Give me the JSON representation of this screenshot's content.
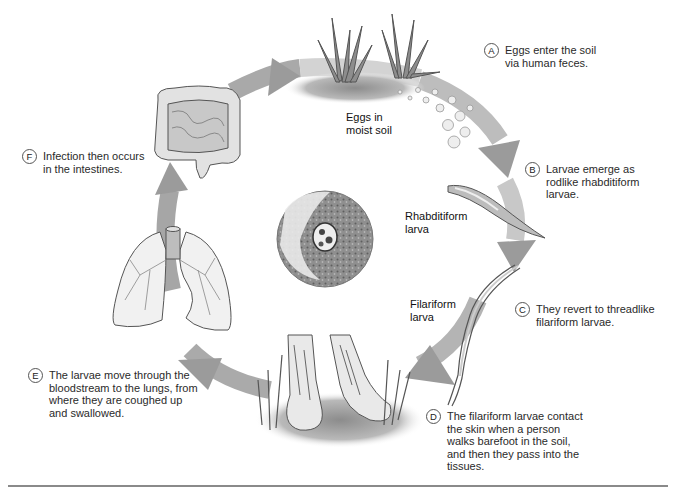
{
  "figure": {
    "type": "life-cycle diagram",
    "accent_colors": {
      "arrow": "#9a9a9a",
      "arrow_light": "#d8d8d8",
      "outline": "#555555",
      "rule": "#8a8a8a"
    }
  },
  "steps": [
    {
      "letter": "A",
      "text": "Eggs enter the soil\nvia human feces."
    },
    {
      "letter": "B",
      "text": "Larvae emerge as\nrodlike rhabditiform\nlarvae."
    },
    {
      "letter": "C",
      "text": "They revert to threadlike\nfilariform larvae."
    },
    {
      "letter": "D",
      "text": "The filariform larvae contact\nthe skin when a person\nwalks barefoot in the soil,\nand then they pass into the\ntissues."
    },
    {
      "letter": "E",
      "text": "The larvae move through the\nbloodstream to the lungs, from\nwhere they are coughed up\nand swallowed."
    },
    {
      "letter": "F",
      "text": "Infection then occurs\nin the intestines."
    }
  ],
  "labels": {
    "eggs": "Eggs in\nmoist soil",
    "rhabditiform": "Rhabditiform\nlarva",
    "filariform": "Filariform\nlarva"
  },
  "illustrations": [
    {
      "name": "grass-tufts-icon",
      "depicts": "grass in soil with eggs"
    },
    {
      "name": "rhabditiform-larva-icon",
      "depicts": "rodlike larva"
    },
    {
      "name": "filariform-larva-icon",
      "depicts": "threadlike larva"
    },
    {
      "name": "bare-feet-icon",
      "depicts": "bare feet in grass"
    },
    {
      "name": "lungs-icon",
      "depicts": "lungs and trachea"
    },
    {
      "name": "intestines-icon",
      "depicts": "large and small intestines"
    },
    {
      "name": "micrograph-icon",
      "depicts": "tissue section with larva"
    }
  ]
}
